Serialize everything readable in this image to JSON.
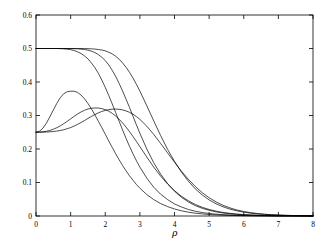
{
  "chart_data": {
    "type": "line",
    "title": "",
    "xlabel": "ρ",
    "ylabel": "",
    "xlim": [
      0,
      8
    ],
    "ylim": [
      0,
      0.6
    ],
    "xticks": [
      0,
      1,
      2,
      3,
      4,
      5,
      6,
      7,
      8
    ],
    "xticklabels": [
      "0",
      "1",
      "2",
      "3",
      "4",
      "5",
      "6",
      "7",
      "8"
    ],
    "yticks": [
      0,
      0.1,
      0.2,
      0.3,
      0.4,
      0.5,
      0.6
    ],
    "yticklabels": [
      "0",
      "0.1",
      "0.2",
      "0.3",
      "0.4",
      "0.5",
      "0.6"
    ],
    "grid": false,
    "legend": "none",
    "line_color": "#000000",
    "line_width": 0.7,
    "background": "#ffffff",
    "x": [
      0,
      0.1,
      0.2,
      0.3,
      0.4,
      0.5,
      0.6,
      0.7,
      0.8,
      0.9,
      1,
      1.1,
      1.2,
      1.3,
      1.4,
      1.5,
      1.6,
      1.7,
      1.8,
      1.9,
      2,
      2.1,
      2.2,
      2.3,
      2.4,
      2.5,
      2.6,
      2.7,
      2.8,
      2.9,
      3,
      3.2,
      3.4,
      3.6,
      3.8,
      4,
      4.2,
      4.4,
      4.6,
      4.8,
      5,
      5.2,
      5.4,
      5.6,
      5.8,
      6,
      6.2,
      6.4,
      6.6,
      6.8,
      7,
      7.2,
      7.4,
      7.6,
      7.8,
      8
    ],
    "series": [
      {
        "name": "sigmoid-1",
        "kind": "plateau-decay",
        "plateau": 0.5,
        "values": [
          0.5,
          0.5,
          0.5,
          0.5,
          0.5,
          0.5,
          0.5,
          0.4995,
          0.499,
          0.498,
          0.4965,
          0.494,
          0.49,
          0.485,
          0.478,
          0.469,
          0.457,
          0.443,
          0.426,
          0.406,
          0.384,
          0.36,
          0.335,
          0.309,
          0.283,
          0.257,
          0.232,
          0.208,
          0.186,
          0.165,
          0.146,
          0.113,
          0.086,
          0.065,
          0.049,
          0.036,
          0.027,
          0.0195,
          0.0143,
          0.0104,
          0.0076,
          0.0055,
          0.004,
          0.0029,
          0.0021,
          0.0015,
          0.0011,
          0.0008,
          0.0006,
          0.0004,
          0.0003,
          0.0002,
          0.00015,
          0.0001,
          7e-05,
          5e-05
        ]
      },
      {
        "name": "sigmoid-2",
        "kind": "plateau-decay",
        "plateau": 0.5,
        "values": [
          0.5,
          0.5,
          0.5,
          0.5,
          0.5,
          0.5,
          0.5,
          0.5,
          0.5,
          0.5,
          0.4998,
          0.4995,
          0.499,
          0.4982,
          0.497,
          0.495,
          0.492,
          0.488,
          0.482,
          0.474,
          0.464,
          0.451,
          0.435,
          0.417,
          0.396,
          0.373,
          0.349,
          0.324,
          0.298,
          0.272,
          0.247,
          0.2,
          0.159,
          0.125,
          0.097,
          0.074,
          0.056,
          0.042,
          0.031,
          0.023,
          0.017,
          0.0124,
          0.009,
          0.0066,
          0.0048,
          0.0035,
          0.0025,
          0.0018,
          0.0013,
          0.00095,
          0.0007,
          0.0005,
          0.00035,
          0.00025,
          0.00018,
          0.00012
        ]
      },
      {
        "name": "sigmoid-3",
        "kind": "plateau-decay",
        "plateau": 0.5,
        "values": [
          0.5,
          0.5,
          0.5,
          0.5,
          0.5,
          0.5,
          0.5,
          0.5,
          0.5,
          0.5,
          0.5,
          0.5,
          0.5,
          0.4999,
          0.4998,
          0.4995,
          0.499,
          0.4983,
          0.497,
          0.4955,
          0.493,
          0.489,
          0.484,
          0.477,
          0.468,
          0.457,
          0.444,
          0.429,
          0.412,
          0.393,
          0.373,
          0.329,
          0.284,
          0.24,
          0.199,
          0.163,
          0.131,
          0.104,
          0.081,
          0.063,
          0.048,
          0.0365,
          0.0275,
          0.0206,
          0.0154,
          0.0114,
          0.0084,
          0.0062,
          0.0046,
          0.0034,
          0.0025,
          0.0018,
          0.0013,
          0.00095,
          0.0007,
          0.0005
        ]
      },
      {
        "name": "bump-1",
        "kind": "rise-peak-decay",
        "start": 0.25,
        "peak_x": 1.1,
        "peak_y": 0.372,
        "values": [
          0.25,
          0.253,
          0.262,
          0.277,
          0.296,
          0.316,
          0.336,
          0.353,
          0.365,
          0.371,
          0.3725,
          0.3725,
          0.369,
          0.361,
          0.35,
          0.336,
          0.32,
          0.302,
          0.283,
          0.264,
          0.244,
          0.224,
          0.205,
          0.186,
          0.168,
          0.151,
          0.135,
          0.12,
          0.107,
          0.094,
          0.083,
          0.064,
          0.049,
          0.037,
          0.028,
          0.021,
          0.0155,
          0.0114,
          0.0084,
          0.0062,
          0.0045,
          0.0033,
          0.0024,
          0.0018,
          0.0013,
          0.00095,
          0.0007,
          0.0005,
          0.00036,
          0.00026,
          0.00019,
          0.00014,
          0.0001,
          7e-05,
          5e-05,
          4e-05
        ]
      },
      {
        "name": "bump-2",
        "kind": "rise-peak-decay",
        "start": 0.25,
        "peak_x": 1.95,
        "peak_y": 0.322,
        "values": [
          0.25,
          0.2505,
          0.2515,
          0.253,
          0.2555,
          0.259,
          0.2635,
          0.269,
          0.2755,
          0.2825,
          0.29,
          0.2975,
          0.3045,
          0.3105,
          0.3155,
          0.3195,
          0.3215,
          0.3225,
          0.3222,
          0.3205,
          0.3175,
          0.313,
          0.3065,
          0.2985,
          0.289,
          0.278,
          0.2655,
          0.252,
          0.2375,
          0.2225,
          0.207,
          0.176,
          0.146,
          0.119,
          0.0955,
          0.0755,
          0.059,
          0.0455,
          0.0345,
          0.026,
          0.0195,
          0.0145,
          0.0107,
          0.0079,
          0.0058,
          0.0042,
          0.0031,
          0.0022,
          0.0016,
          0.0012,
          0.00085,
          0.00062,
          0.00045,
          0.00032,
          0.00023,
          0.00017
        ]
      },
      {
        "name": "bump-3",
        "kind": "rise-peak-decay",
        "start": 0.25,
        "peak_x": 2.55,
        "peak_y": 0.318,
        "values": [
          0.25,
          0.2501,
          0.2503,
          0.2507,
          0.2513,
          0.2522,
          0.2535,
          0.2552,
          0.2575,
          0.2605,
          0.264,
          0.2685,
          0.2735,
          0.279,
          0.285,
          0.2912,
          0.2972,
          0.3028,
          0.3078,
          0.312,
          0.3152,
          0.3175,
          0.3188,
          0.3192,
          0.3185,
          0.3168,
          0.3138,
          0.3095,
          0.3038,
          0.2968,
          0.2885,
          0.268,
          0.2435,
          0.2165,
          0.1885,
          0.1605,
          0.1338,
          0.1095,
          0.0882,
          0.0698,
          0.0545,
          0.042,
          0.032,
          0.0242,
          0.0181,
          0.0135,
          0.01,
          0.0074,
          0.0054,
          0.004,
          0.0029,
          0.0021,
          0.0015,
          0.0011,
          0.0008,
          0.0006
        ]
      }
    ]
  }
}
